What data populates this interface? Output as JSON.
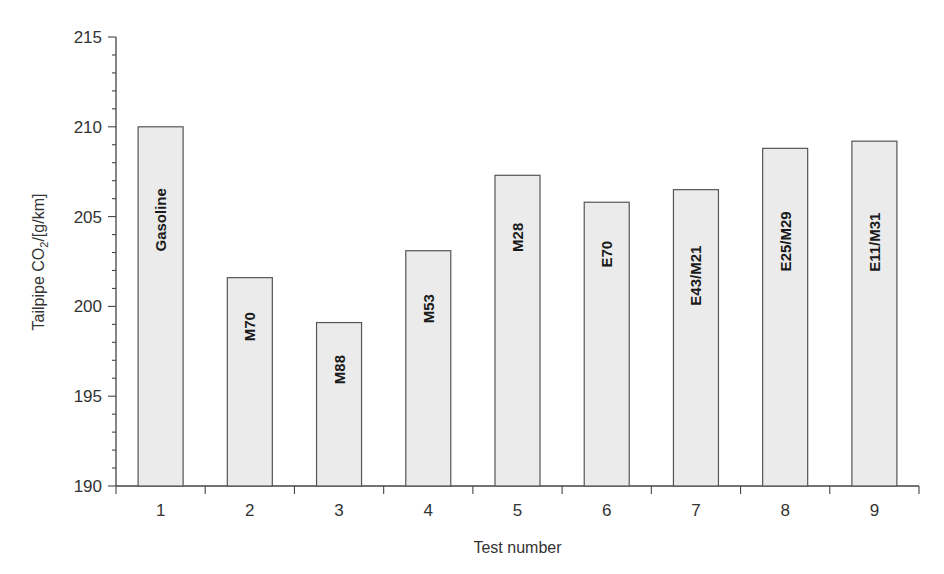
{
  "chart_data": {
    "type": "bar",
    "title": "",
    "xlabel": "Test number",
    "ylabel": "Tailpipe CO2/[g/km]",
    "ylabel_main": "Tailpipe CO",
    "ylabel_sub": "2",
    "ylabel_tail": "/[g/km]",
    "ylim": [
      190,
      215
    ],
    "yticks": [
      190,
      195,
      200,
      205,
      210,
      215
    ],
    "y_minor_step": 1,
    "grid": false,
    "legend": null,
    "categories": [
      "1",
      "2",
      "3",
      "4",
      "5",
      "6",
      "7",
      "8",
      "9"
    ],
    "values": [
      210.0,
      201.6,
      199.1,
      203.1,
      207.3,
      205.8,
      206.5,
      208.8,
      209.2
    ],
    "bar_labels": [
      "Gasoline",
      "M70",
      "M88",
      "M53",
      "M28",
      "E70",
      "E43/M21",
      "E25/M29",
      "E11/M31"
    ],
    "colors": {
      "bar_fill": "#ebebeb",
      "bar_stroke": "#555555",
      "axis": "#444444",
      "text": "#333333"
    }
  }
}
